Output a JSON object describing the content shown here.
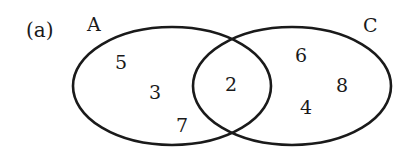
{
  "diagram": {
    "type": "venn",
    "part_label": "(a)",
    "sets": [
      {
        "name": "A",
        "label": "A",
        "only_elements": [
          "5",
          "3",
          "7"
        ]
      },
      {
        "name": "C",
        "label": "C",
        "only_elements": [
          "6",
          "8",
          "4"
        ]
      }
    ],
    "intersection": {
      "sets": [
        "A",
        "C"
      ],
      "elements": [
        "2"
      ]
    }
  }
}
